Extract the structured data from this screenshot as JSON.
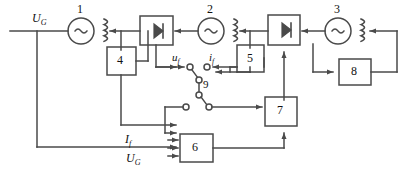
{
  "diagram": {
    "stroke_color": "#4a4a4a",
    "text_color": "#111111",
    "background": "#ffffff",
    "blocks": [
      {
        "id": "4",
        "label": "4"
      },
      {
        "id": "5",
        "label": "5"
      },
      {
        "id": "6",
        "label": "6"
      },
      {
        "id": "7",
        "label": "7"
      },
      {
        "id": "8",
        "label": "8"
      }
    ],
    "machines": [
      {
        "id": "1",
        "label": "1",
        "symbol": "~"
      },
      {
        "id": "2",
        "label": "2",
        "symbol": "~"
      },
      {
        "id": "3",
        "label": "3",
        "symbol": "~"
      }
    ],
    "converters": [
      {
        "id": "conv-left",
        "symbol": "diode"
      },
      {
        "id": "conv-right",
        "symbol": "diode"
      }
    ],
    "switch": {
      "id": "9",
      "label": "9"
    },
    "signals": {
      "u_f": {
        "base": "u",
        "sub": "f"
      },
      "i_f": {
        "base": "i",
        "sub": "f"
      },
      "I_f": {
        "base": "I",
        "sub": "f"
      },
      "U_G_top": {
        "base": "U",
        "sub": "G"
      },
      "U_G_bottom": {
        "base": "U",
        "sub": "G"
      }
    }
  }
}
